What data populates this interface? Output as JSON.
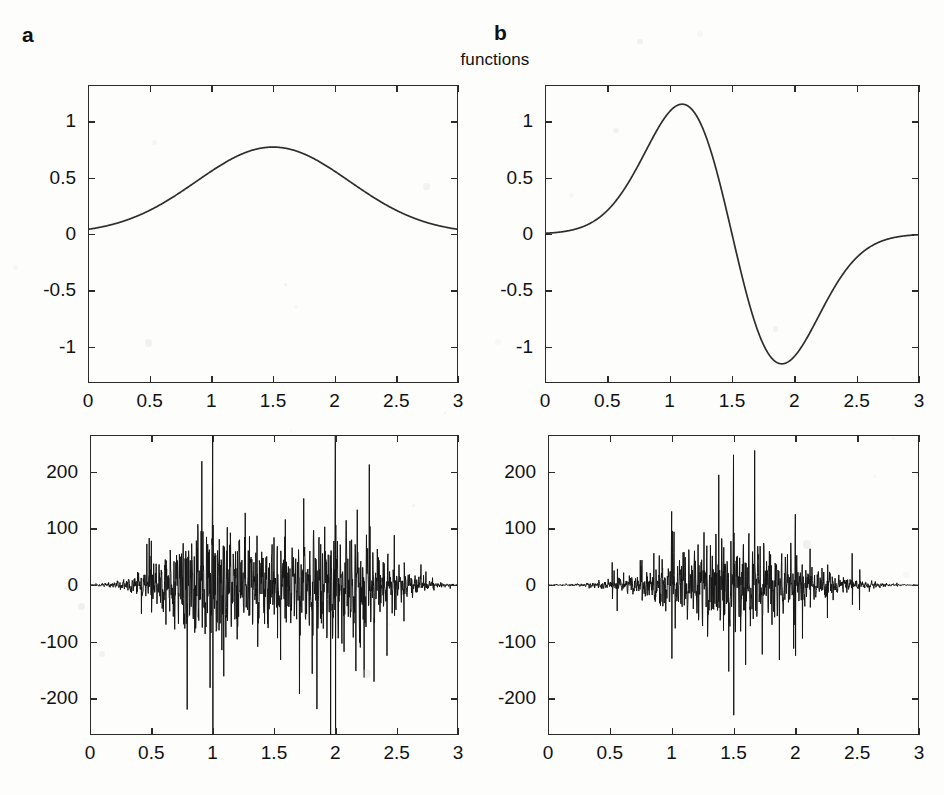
{
  "figure": {
    "title": "functions",
    "background_color": "#fdfdfc",
    "ink_color": "#2b2b2b",
    "panels": [
      {
        "letter": "a"
      },
      {
        "letter": "b"
      }
    ]
  },
  "chart_data": [
    {
      "id": "panel-a-function",
      "type": "line",
      "title": "",
      "xlabel": "",
      "ylabel": "",
      "xlim": [
        0,
        3
      ],
      "ylim": [
        -1.32,
        1.32
      ],
      "xticks": [
        0,
        0.5,
        1,
        1.5,
        2,
        2.5,
        3
      ],
      "xticklabels": [
        "0",
        "0.5",
        "1",
        "1.5",
        "2",
        "2.5",
        "3"
      ],
      "yticks": [
        1,
        0.5,
        0,
        -0.5,
        -1
      ],
      "yticklabels": [
        "1",
        "0.5",
        "0",
        "-0.5",
        "-1"
      ],
      "grid": false,
      "legend": null,
      "series": [
        {
          "name": "gaussian bump",
          "model": "gaussian",
          "amplitude": 0.77,
          "center": 1.5,
          "sigma": 0.62,
          "x": [
            0,
            0.15,
            0.3,
            0.45,
            0.6,
            0.75,
            0.9,
            1.05,
            1.2,
            1.35,
            1.5,
            1.65,
            1.8,
            1.95,
            2.1,
            2.25,
            2.4,
            2.55,
            2.7,
            2.85,
            3
          ],
          "values": [
            0.01,
            0.02,
            0.04,
            0.08,
            0.15,
            0.25,
            0.38,
            0.53,
            0.66,
            0.75,
            0.77,
            0.75,
            0.66,
            0.53,
            0.38,
            0.25,
            0.15,
            0.08,
            0.04,
            0.02,
            0.01
          ]
        }
      ]
    },
    {
      "id": "panel-b-function",
      "type": "line",
      "title": "",
      "xlabel": "",
      "ylabel": "",
      "xlim": [
        0,
        3
      ],
      "ylim": [
        -1.32,
        1.32
      ],
      "xticks": [
        0,
        0.5,
        1,
        1.5,
        2,
        2.5,
        3
      ],
      "xticklabels": [
        "0",
        "0.5",
        "1",
        "1.5",
        "2",
        "2.5",
        "3"
      ],
      "yticks": [
        1,
        0.5,
        0,
        -0.5,
        -1
      ],
      "yticklabels": [
        "1",
        "0.5",
        "0",
        "-0.5",
        "-1"
      ],
      "grid": false,
      "legend": null,
      "series": [
        {
          "name": "gaussian derivative",
          "model": "gaussian-derivative",
          "amplitude": 1.15,
          "center": 1.5,
          "sigma": 0.4,
          "peak_x": 1.1,
          "peak_y": 1.15,
          "trough_x": 1.88,
          "trough_y": -1.15,
          "x": [
            0,
            0.2,
            0.4,
            0.6,
            0.75,
            0.9,
            1.0,
            1.1,
            1.2,
            1.3,
            1.4,
            1.5,
            1.6,
            1.7,
            1.8,
            1.88,
            2.0,
            2.1,
            2.25,
            2.4,
            2.6,
            2.8,
            3.0
          ],
          "values": [
            0.0,
            0.06,
            0.16,
            0.35,
            0.55,
            0.85,
            1.04,
            1.15,
            1.12,
            0.92,
            0.58,
            0.13,
            -0.38,
            -0.8,
            -1.08,
            -1.15,
            -1.05,
            -0.88,
            -0.62,
            -0.4,
            -0.19,
            -0.06,
            0.03
          ]
        }
      ]
    },
    {
      "id": "panel-a-coefficients",
      "type": "line",
      "title": "",
      "xlabel": "",
      "ylabel": "",
      "xlim": [
        0,
        3
      ],
      "ylim": [
        -265,
        265
      ],
      "xticks": [
        0,
        0.5,
        1,
        1.5,
        2,
        2.5,
        3
      ],
      "xticklabels": [
        "0",
        "0.5",
        "1",
        "1.5",
        "2",
        "2.5",
        "3"
      ],
      "yticks": [
        200,
        100,
        0,
        -100,
        -200
      ],
      "yticklabels": [
        "200",
        "100",
        "0",
        "-100",
        "-200"
      ],
      "grid": false,
      "legend": null,
      "series": [
        {
          "name": "oscillatory coefficients",
          "model": "spiky-oscillation",
          "seed": 1971,
          "n_points": 1560,
          "baseline_amplitude": 9,
          "envelope_centers": [
            1.0,
            2.0
          ],
          "envelope_sigma": 0.33,
          "envelope_amplitude": 95,
          "major_spikes": [
            {
              "x": 1.0,
              "amplitude": 265
            },
            {
              "x": 2.0,
              "amplitude": 265
            }
          ],
          "minor_spikes": [
            {
              "x": 0.5,
              "amplitude": 78
            },
            {
              "x": 0.62,
              "amplitude": -70
            },
            {
              "x": 0.78,
              "amplitude": 60
            },
            {
              "x": 0.88,
              "amplitude": 92
            },
            {
              "x": 1.12,
              "amplitude": 102
            },
            {
              "x": 1.2,
              "amplitude": -96
            },
            {
              "x": 1.3,
              "amplitude": 86
            },
            {
              "x": 1.5,
              "amplitude": 84
            },
            {
              "x": 1.6,
              "amplitude": -66
            },
            {
              "x": 1.88,
              "amplitude": 72
            },
            {
              "x": 2.12,
              "amplitude": 78
            },
            {
              "x": 2.25,
              "amplitude": -74
            },
            {
              "x": 2.48,
              "amplitude": 88
            },
            {
              "x": 2.56,
              "amplitude": -64
            }
          ]
        }
      ]
    },
    {
      "id": "panel-b-coefficients",
      "type": "line",
      "title": "",
      "xlabel": "",
      "ylabel": "",
      "xlim": [
        0,
        3
      ],
      "ylim": [
        -265,
        265
      ],
      "xticks": [
        0,
        0.5,
        1,
        1.5,
        2,
        2.5,
        3
      ],
      "xticklabels": [
        "0",
        "0.5",
        "1",
        "1.5",
        "2",
        "2.5",
        "3"
      ],
      "yticks": [
        200,
        100,
        0,
        -100,
        -200
      ],
      "yticklabels": [
        "200",
        "100",
        "0",
        "-100",
        "-200"
      ],
      "grid": false,
      "legend": null,
      "series": [
        {
          "name": "oscillatory coefficients",
          "model": "spiky-oscillation",
          "seed": 4493,
          "n_points": 1560,
          "baseline_amplitude": 8,
          "envelope_centers": [
            1.5
          ],
          "envelope_sigma": 0.42,
          "envelope_amplitude": 78,
          "major_spikes": [
            {
              "x": 1.0,
              "amplitude": 130
            },
            {
              "x": 1.5,
              "amplitude": 230
            },
            {
              "x": 2.0,
              "amplitude": 125
            }
          ],
          "minor_spikes": [
            {
              "x": 0.52,
              "amplitude": 40
            },
            {
              "x": 0.56,
              "amplitude": -46
            },
            {
              "x": 0.76,
              "amplitude": 44
            },
            {
              "x": 0.9,
              "amplitude": 52
            },
            {
              "x": 1.1,
              "amplitude": 58
            },
            {
              "x": 1.22,
              "amplitude": -56
            },
            {
              "x": 1.36,
              "amplitude": 62
            },
            {
              "x": 1.58,
              "amplitude": 72
            },
            {
              "x": 1.66,
              "amplitude": -60
            },
            {
              "x": 1.8,
              "amplitude": 54
            },
            {
              "x": 2.12,
              "amplitude": 64
            },
            {
              "x": 2.26,
              "amplitude": -58
            },
            {
              "x": 2.46,
              "amplitude": 56
            },
            {
              "x": 2.52,
              "amplitude": -44
            }
          ]
        }
      ]
    }
  ]
}
